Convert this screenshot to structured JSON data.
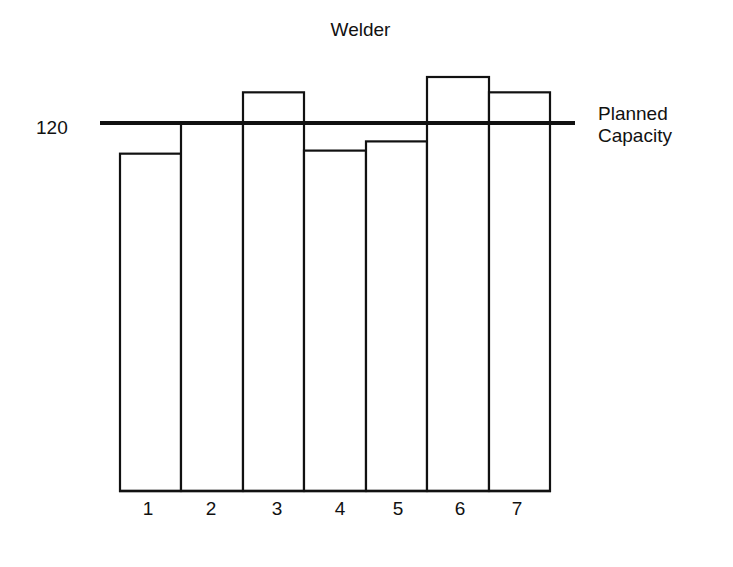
{
  "chart_data": {
    "type": "bar",
    "title": "Welder",
    "xlabel": "",
    "ylabel": "",
    "categories": [
      "1",
      "2",
      "3",
      "4",
      "5",
      "6",
      "7"
    ],
    "values": [
      110,
      120,
      130,
      111,
      114,
      135,
      130
    ],
    "ylim": [
      0,
      140
    ],
    "y_ticks": [
      "120"
    ],
    "reference_line": {
      "value": 120,
      "label": "Planned Capacity"
    },
    "grid": false,
    "legend": null
  },
  "labels": {
    "title": "Welder",
    "y_tick": "120",
    "plan_line_1": "Planned",
    "plan_line_2": "Capacity"
  }
}
